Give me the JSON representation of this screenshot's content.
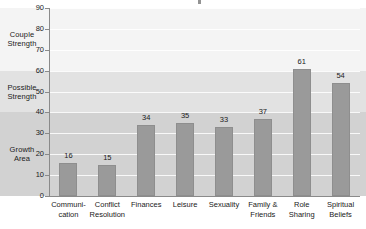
{
  "chart_data": {
    "type": "bar",
    "title": "",
    "xlabel": "",
    "ylabel": "",
    "ylim": [
      0,
      90
    ],
    "ytick_step": 10,
    "grid": true,
    "legend": "none",
    "orientation": "vertical",
    "bar_color": "#9a9a9a",
    "categories": [
      "Communi-\ncation",
      "Conflict\nResolution",
      "Finances",
      "Leisure",
      "Sexuality",
      "Family &\nFriends",
      "Role\nSharing",
      "Spiritual\nBeliefs"
    ],
    "values": [
      16,
      15,
      34,
      35,
      33,
      37,
      61,
      54
    ],
    "yticks": [
      0,
      10,
      20,
      30,
      40,
      50,
      60,
      70,
      80,
      90
    ],
    "bands": [
      {
        "label": "Couple\nStrength",
        "from": 60,
        "to": 90,
        "color": "#f4f4f4"
      },
      {
        "label": "Possible\nStrength",
        "from": 40,
        "to": 60,
        "color": "#e2e2e2"
      },
      {
        "label": "Growth\nArea",
        "from": 0,
        "to": 40,
        "color": "#d2d2d2"
      }
    ]
  },
  "axis": {
    "ticks": [
      "90",
      "80",
      "70",
      "60",
      "50",
      "40",
      "30",
      "20",
      "10",
      "0"
    ]
  },
  "categories": [
    {
      "line1": "Communi-",
      "line2": "cation"
    },
    {
      "line1": "Conflict",
      "line2": "Resolution"
    },
    {
      "line1": "Finances",
      "line2": ""
    },
    {
      "line1": "Leisure",
      "line2": ""
    },
    {
      "line1": "Sexuality",
      "line2": ""
    },
    {
      "line1": "Family &",
      "line2": "Friends"
    },
    {
      "line1": "Role",
      "line2": "Sharing"
    },
    {
      "line1": "Spiritual",
      "line2": "Beliefs"
    }
  ],
  "values": [
    "16",
    "15",
    "34",
    "35",
    "33",
    "37",
    "61",
    "54"
  ],
  "zones": [
    {
      "line1": "Couple",
      "line2": "Strength"
    },
    {
      "line1": "Possible",
      "line2": "Strength"
    },
    {
      "line1": "Growth",
      "line2": "Area"
    }
  ]
}
